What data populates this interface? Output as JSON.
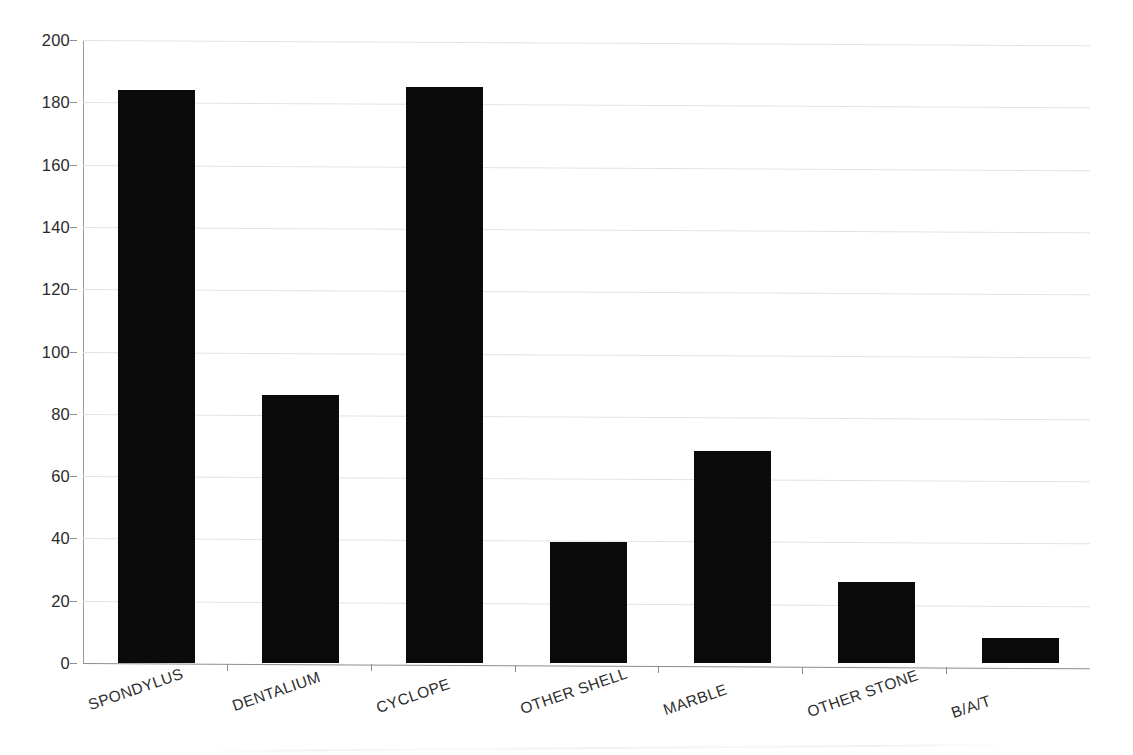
{
  "chart_data": {
    "type": "bar",
    "title": "",
    "subtitle": "",
    "xlabel": "",
    "ylabel": "",
    "categories": [
      "SPONDYLUS",
      "DENTALIUM",
      "CYCLOPE",
      "OTHER SHELL",
      "MARBLE",
      "OTHER STONE",
      "B/A/T"
    ],
    "values": [
      184,
      86,
      185,
      39,
      68,
      26,
      8
    ],
    "ylim": [
      0,
      200
    ],
    "yticks": [
      0,
      20,
      40,
      60,
      80,
      100,
      120,
      140,
      160,
      180,
      200
    ],
    "ytick_labels": [
      "0",
      "20",
      "40",
      "60",
      "80",
      "100",
      "120",
      "140",
      "160",
      "180",
      "200"
    ],
    "grid": true,
    "grid_axis": "y",
    "legend": false,
    "legend_position": "none",
    "bar_color": "#0b0b0b",
    "grid_color": "#e3e3e3",
    "axis_color": "#8d8d8d",
    "background_color": "#ffffff",
    "xtick_label_rotation": -19
  }
}
